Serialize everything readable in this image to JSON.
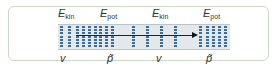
{
  "diagram": {
    "top_labels": [
      {
        "symbol": "E",
        "sub": "kin",
        "x": 58
      },
      {
        "symbol": "E",
        "sub": "pot",
        "x": 100
      },
      {
        "symbol": "E",
        "sub": "kin",
        "x": 152
      },
      {
        "symbol": "E",
        "sub": "pot",
        "x": 203
      }
    ],
    "bottom_labels": [
      {
        "text": "v",
        "x": 60
      },
      {
        "text": "p̃",
        "x": 107
      },
      {
        "text": "v",
        "x": 156
      },
      {
        "text": "p̃",
        "x": 206
      }
    ],
    "dot_columns_x": [
      60,
      68,
      76,
      82,
      88,
      94,
      99,
      105,
      111,
      132,
      146,
      160,
      174,
      199,
      206,
      212,
      218,
      224
    ],
    "dots_per_column": 7,
    "arrow": {
      "from_x": 76,
      "to_x": 198,
      "y": 35
    },
    "colors": {
      "frame_border": "#cdd8c6",
      "band_fill": "#e2e8ec",
      "dot": "#3d6d96",
      "text": "#333333",
      "arrow": "#222222"
    }
  }
}
